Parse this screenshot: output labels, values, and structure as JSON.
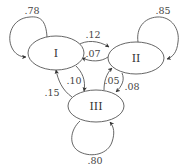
{
  "diagram": {
    "type": "markov-chain-state-diagram",
    "nodes": [
      {
        "id": "I",
        "label": "I"
      },
      {
        "id": "II",
        "label": "II"
      },
      {
        "id": "III",
        "label": "III"
      }
    ],
    "edges": [
      {
        "from": "I",
        "to": "I",
        "label": ".78"
      },
      {
        "from": "II",
        "to": "II",
        "label": ".85"
      },
      {
        "from": "III",
        "to": "III",
        "label": ".80"
      },
      {
        "from": "I",
        "to": "II",
        "label": ".12"
      },
      {
        "from": "II",
        "to": "I",
        "label": ".07"
      },
      {
        "from": "I",
        "to": "III",
        "label": ".10"
      },
      {
        "from": "III",
        "to": "I",
        "label": ".15"
      },
      {
        "from": "III",
        "to": "II",
        "label": ".05"
      },
      {
        "from": "II",
        "to": "III",
        "label": ".08"
      }
    ]
  }
}
